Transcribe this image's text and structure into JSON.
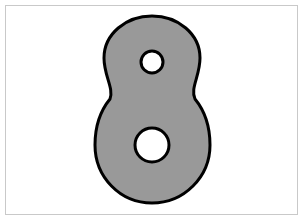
{
  "image": {
    "width": 304,
    "height": 221,
    "background_color": "#ffffff",
    "description": "Line drawing of the numeral eight"
  },
  "frame": {
    "name": "image-border",
    "color": "#c9c9c9",
    "inset_px": 5,
    "stroke_width": 1
  },
  "glyph": {
    "character": "8",
    "label": "eight",
    "fill_color": "#999999",
    "stroke_color": "#000000",
    "stroke_width": 3,
    "bounds": {
      "left": 95,
      "top": 16,
      "right": 210,
      "bottom": 203
    },
    "top_lobe": {
      "name": "upper-lobe",
      "center_x": 152,
      "center_y": 62,
      "radius_x": 48,
      "radius_y": 46
    },
    "bottom_lobe": {
      "name": "lower-lobe",
      "center_x": 152,
      "center_y": 145,
      "radius_x": 58,
      "radius_y": 58
    },
    "waist": {
      "name": "waist-notch",
      "y": 99,
      "left_x": 110,
      "right_x": 195
    },
    "counters": [
      {
        "name": "upper-counter",
        "center_x": 152,
        "center_y": 62,
        "radius": 11,
        "fill_color": "#ffffff"
      },
      {
        "name": "lower-counter",
        "center_x": 152,
        "center_y": 145,
        "radius": 17,
        "fill_color": "#ffffff"
      }
    ],
    "path": "M 152 16 C 178 16 200 34 200 58 C 200 76 190 88 195 99 C 204 110 210 126 210 145 C 210 177 184 203 152 203 C 120 203 95 177 95 145 C 95 126 101 110 110 99 C 114 88 104 76 104 58 C 104 34 126 16 152 16 Z"
  }
}
